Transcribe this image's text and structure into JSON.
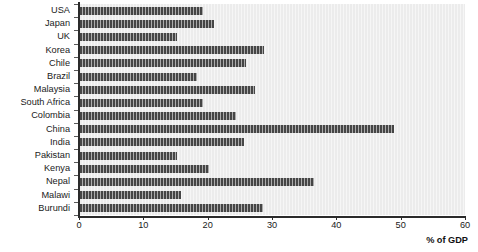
{
  "chart_data": {
    "type": "bar",
    "orientation": "horizontal",
    "title": "",
    "xlabel": "% of GDP",
    "ylabel": "",
    "xlim": [
      0,
      60
    ],
    "xticks": [
      0,
      10,
      20,
      30,
      40,
      50,
      60
    ],
    "xtick_labels": [
      "0",
      "10",
      "20",
      "30",
      "40",
      "50",
      "60"
    ],
    "grid": false,
    "legend": false,
    "bar_color": "#454545",
    "plot_background": "#ececec",
    "categories": [
      "USA",
      "Japan",
      "UK",
      "Korea",
      "Chile",
      "Brazil",
      "Malaysia",
      "South Africa",
      "Colombia",
      "China",
      "India",
      "Pakistan",
      "Kenya",
      "Nepal",
      "Malawi",
      "Burundi"
    ],
    "values": [
      19.2,
      21.0,
      15.2,
      28.7,
      26.0,
      18.4,
      27.3,
      19.2,
      24.4,
      49.0,
      25.6,
      15.2,
      20.2,
      36.5,
      15.8,
      28.6
    ]
  }
}
